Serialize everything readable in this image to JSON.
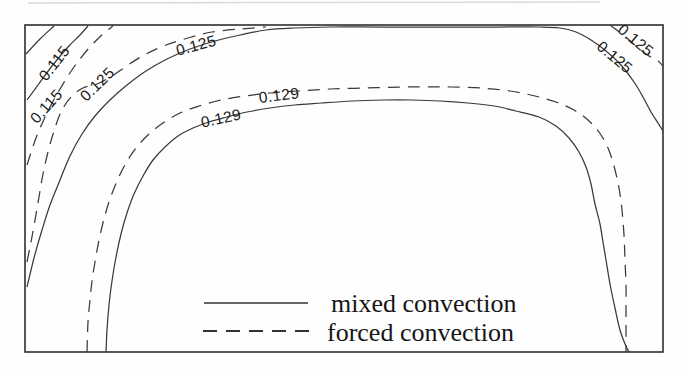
{
  "legend": {
    "items": [
      {
        "label": "mixed convection",
        "style": "solid"
      },
      {
        "label": "forced convection",
        "style": "dashed"
      }
    ]
  },
  "chart_data": {
    "type": "contour",
    "title": "",
    "xlabel": "",
    "ylabel": "",
    "grid": false,
    "legend_position": "inside-bottom-center",
    "levels": [
      0.115,
      0.125,
      0.129
    ],
    "series": [
      {
        "name": "mixed convection",
        "line_style": "solid"
      },
      {
        "name": "forced convection",
        "line_style": "dashed"
      }
    ],
    "colors": {
      "line": "#3a3a3a",
      "label_text": "#1b1b1b",
      "frame": "#2e2e2e",
      "background": "#fefefe"
    },
    "frame": {
      "x": 25,
      "y": 25,
      "width": 638,
      "height": 327
    },
    "contour_labels": [
      {
        "text": "0.115",
        "level": 0.115,
        "series": "mixed convection",
        "x": 54,
        "y": 63,
        "rot": -52
      },
      {
        "text": "0.115",
        "level": 0.115,
        "series": "forced convection",
        "x": 46,
        "y": 106,
        "rot": -48
      },
      {
        "text": "0.125",
        "level": 0.125,
        "series": "forced convection",
        "x": 97,
        "y": 84,
        "rot": -44
      },
      {
        "text": "0.125",
        "level": 0.125,
        "series": "mixed convection",
        "x": 196,
        "y": 45,
        "rot": -15
      },
      {
        "text": "0.129",
        "level": 0.129,
        "series": "mixed convection",
        "x": 221,
        "y": 118,
        "rot": -12
      },
      {
        "text": "0.129",
        "level": 0.129,
        "series": "forced convection",
        "x": 279,
        "y": 95,
        "rot": -7
      },
      {
        "text": "0.125",
        "level": 0.125,
        "series": "forced convection",
        "x": 636,
        "y": 40,
        "rot": 40
      },
      {
        "text": "0.125",
        "level": 0.125,
        "series": "mixed convection",
        "x": 615,
        "y": 57,
        "rot": 40
      }
    ],
    "curves": [
      {
        "id": "corner-stub-topleft",
        "level": null,
        "series": "mixed convection",
        "style": "solid",
        "points": [
          [
            26,
            54
          ],
          [
            40,
            39
          ],
          [
            54,
            26
          ]
        ]
      },
      {
        "id": "c0115-mixed",
        "level": 0.115,
        "series": "mixed convection",
        "style": "solid",
        "points": [
          [
            27,
            100
          ],
          [
            38,
            85
          ],
          [
            52,
            66
          ],
          [
            68,
            47
          ],
          [
            80,
            35
          ],
          [
            88,
            26
          ]
        ]
      },
      {
        "id": "c0115-forced",
        "level": 0.115,
        "series": "forced convection",
        "style": "dashed",
        "points": [
          [
            27,
            165
          ],
          [
            36,
            138
          ],
          [
            47,
            113
          ],
          [
            60,
            89
          ],
          [
            74,
            67
          ],
          [
            89,
            48
          ],
          [
            103,
            34
          ],
          [
            113,
            26
          ]
        ]
      },
      {
        "id": "c0125-forced-left",
        "level": 0.125,
        "series": "forced convection",
        "style": "dashed",
        "points": [
          [
            27,
            262
          ],
          [
            31,
            242
          ],
          [
            35,
            220
          ],
          [
            39,
            197
          ],
          [
            43,
            174
          ],
          [
            48,
            152
          ],
          [
            54,
            131
          ],
          [
            61,
            112
          ],
          [
            71,
            97
          ],
          [
            83,
            88
          ],
          [
            97,
            84
          ],
          [
            112,
            76
          ],
          [
            128,
            65
          ],
          [
            146,
            54
          ],
          [
            166,
            45
          ],
          [
            188,
            38
          ],
          [
            212,
            32
          ],
          [
            240,
            29
          ],
          [
            266,
            27
          ]
        ]
      },
      {
        "id": "c0125-mixed",
        "level": 0.125,
        "series": "mixed convection",
        "style": "solid",
        "points": [
          [
            27,
            287
          ],
          [
            34,
            258
          ],
          [
            42,
            230
          ],
          [
            50,
            205
          ],
          [
            60,
            180
          ],
          [
            70,
            156
          ],
          [
            82,
            134
          ],
          [
            95,
            116
          ],
          [
            110,
            100
          ],
          [
            127,
            85
          ],
          [
            146,
            71
          ],
          [
            167,
            59
          ],
          [
            190,
            49
          ],
          [
            215,
            41
          ],
          [
            240,
            35
          ],
          [
            266,
            30
          ],
          [
            295,
            28
          ],
          [
            330,
            27
          ],
          [
            380,
            27
          ],
          [
            440,
            27
          ],
          [
            500,
            27
          ],
          [
            540,
            27
          ],
          [
            560,
            28
          ],
          [
            576,
            32
          ],
          [
            591,
            40
          ],
          [
            606,
            51
          ],
          [
            621,
            65
          ],
          [
            634,
            82
          ],
          [
            643,
            97
          ],
          [
            651,
            112
          ],
          [
            658,
            123
          ],
          [
            663,
            131
          ]
        ]
      },
      {
        "id": "c0125-forced-topright",
        "level": 0.125,
        "series": "forced convection",
        "style": "dashed",
        "points": [
          [
            610,
            25
          ],
          [
            622,
            34
          ],
          [
            636,
            46
          ],
          [
            649,
            56
          ],
          [
            658,
            61
          ],
          [
            663,
            66
          ]
        ]
      },
      {
        "id": "c0129-forced",
        "level": 0.129,
        "series": "forced convection",
        "style": "dashed",
        "points": [
          [
            87,
            352
          ],
          [
            88,
            322
          ],
          [
            90,
            300
          ],
          [
            92,
            281
          ],
          [
            95,
            262
          ],
          [
            99,
            240
          ],
          [
            104,
            219
          ],
          [
            110,
            199
          ],
          [
            117,
            181
          ],
          [
            126,
            163
          ],
          [
            136,
            148
          ],
          [
            149,
            134
          ],
          [
            163,
            123
          ],
          [
            180,
            113
          ],
          [
            199,
            106
          ],
          [
            221,
            100
          ],
          [
            245,
            96
          ],
          [
            270,
            93
          ],
          [
            298,
            91
          ],
          [
            330,
            89
          ],
          [
            365,
            88
          ],
          [
            400,
            87
          ],
          [
            425,
            87
          ],
          [
            450,
            87
          ],
          [
            480,
            88
          ],
          [
            510,
            91
          ],
          [
            535,
            96
          ],
          [
            556,
            102
          ],
          [
            574,
            110
          ],
          [
            588,
            120
          ],
          [
            599,
            132
          ],
          [
            608,
            148
          ],
          [
            614,
            166
          ],
          [
            619,
            188
          ],
          [
            622,
            210
          ],
          [
            624,
            235
          ],
          [
            625,
            260
          ],
          [
            626,
            285
          ],
          [
            626,
            310
          ],
          [
            626,
            332
          ],
          [
            626,
            352
          ]
        ]
      },
      {
        "id": "c0129-mixed",
        "level": 0.129,
        "series": "mixed convection",
        "style": "solid",
        "points": [
          [
            106,
            352
          ],
          [
            107,
            330
          ],
          [
            109,
            305
          ],
          [
            112,
            281
          ],
          [
            116,
            257
          ],
          [
            121,
            234
          ],
          [
            127,
            213
          ],
          [
            134,
            194
          ],
          [
            143,
            176
          ],
          [
            153,
            160
          ],
          [
            165,
            147
          ],
          [
            178,
            136
          ],
          [
            193,
            128
          ],
          [
            209,
            122
          ],
          [
            227,
            117
          ],
          [
            247,
            112
          ],
          [
            270,
            108
          ],
          [
            295,
            105
          ],
          [
            322,
            103
          ],
          [
            352,
            101
          ],
          [
            384,
            100
          ],
          [
            412,
            100
          ],
          [
            440,
            101
          ],
          [
            468,
            103
          ],
          [
            494,
            106
          ],
          [
            516,
            111
          ],
          [
            539,
            117
          ],
          [
            556,
            126
          ],
          [
            569,
            138
          ],
          [
            579,
            152
          ],
          [
            586,
            167
          ],
          [
            591,
            184
          ],
          [
            595,
            204
          ],
          [
            600,
            224
          ],
          [
            603,
            242
          ],
          [
            606,
            260
          ],
          [
            610,
            284
          ],
          [
            615,
            308
          ],
          [
            620,
            330
          ],
          [
            625,
            344
          ],
          [
            629,
            352
          ]
        ]
      }
    ]
  }
}
